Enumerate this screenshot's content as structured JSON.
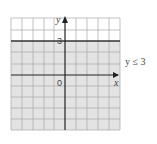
{
  "diagram": {
    "type": "inequality-graph",
    "inequality_label": "y ≤ 3",
    "boundary_value": 3,
    "boundary_style": "solid",
    "shaded_region": "below",
    "axes": {
      "x_label": "x",
      "y_label": "y",
      "origin_label": "0",
      "tick_label_y": "3"
    },
    "grid": {
      "columns": 10,
      "rows": 10,
      "x_range": [
        -5,
        5
      ],
      "y_range": [
        -5,
        5
      ]
    },
    "colors": {
      "shade": "#e3e3e3",
      "grid_line": "#a8a8a8",
      "axis": "#222222",
      "boundary": "#333333",
      "text": "#444444"
    }
  }
}
